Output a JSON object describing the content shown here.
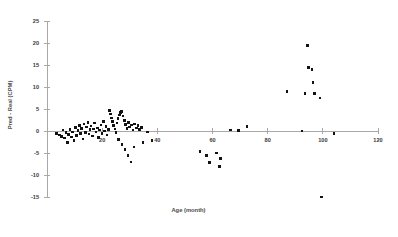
{
  "chart_data": {
    "type": "scatter",
    "title": "",
    "xlabel": "Age (month)",
    "ylabel": "Pred - Real (CPM)",
    "xlim": [
      0,
      120
    ],
    "ylim": [
      -15,
      25
    ],
    "xticks": [
      0,
      20,
      40,
      60,
      80,
      100,
      120
    ],
    "xtick_labels": [
      "",
      "20",
      "40",
      "60",
      "80",
      "100",
      "120"
    ],
    "yticks": [
      -15,
      -10,
      -5,
      0,
      5,
      10,
      15,
      20,
      25
    ],
    "ytick_labels": [
      "-15",
      "-10",
      "-5",
      "0",
      "5",
      "10",
      "15",
      "20",
      "25"
    ],
    "grid": false,
    "legend": null,
    "marker": {
      "shape": "square",
      "size": 2.6,
      "color": "#121212"
    },
    "series": [
      {
        "name": "Pred - Real",
        "points": [
          [
            3.5,
            -0.6
          ],
          [
            4.5,
            -0.9
          ],
          [
            5.2,
            -1.2
          ],
          [
            5.8,
            0.2
          ],
          [
            6.3,
            -1.6
          ],
          [
            6.9,
            -0.4
          ],
          [
            7.4,
            -2.6
          ],
          [
            7.9,
            -0.8
          ],
          [
            8.4,
            0.4
          ],
          [
            8.9,
            -1.4
          ],
          [
            9.3,
            -0.2
          ],
          [
            9.8,
            -2.2
          ],
          [
            10.3,
            0.8
          ],
          [
            10.8,
            -1.0
          ],
          [
            11.2,
            0.1
          ],
          [
            11.7,
            1.2
          ],
          [
            12.1,
            -0.5
          ],
          [
            12.6,
            0.6
          ],
          [
            13.0,
            -1.8
          ],
          [
            13.4,
            1.6
          ],
          [
            13.9,
            -0.3
          ],
          [
            14.3,
            0.9
          ],
          [
            14.8,
            2.0
          ],
          [
            15.2,
            -0.7
          ],
          [
            15.6,
            0.3
          ],
          [
            16.0,
            1.1
          ],
          [
            16.5,
            -1.1
          ],
          [
            16.9,
            0.5
          ],
          [
            17.3,
            1.8
          ],
          [
            17.8,
            -0.2
          ],
          [
            18.2,
            0.7
          ],
          [
            18.7,
            -1.5
          ],
          [
            19.1,
            0.2
          ],
          [
            19.6,
            1.4
          ],
          [
            20.0,
            -0.6
          ],
          [
            20.5,
            2.2
          ],
          [
            20.9,
            0.0
          ],
          [
            21.4,
            1.0
          ],
          [
            21.8,
            -0.9
          ],
          [
            22.3,
            0.4
          ],
          [
            22.7,
            4.6
          ],
          [
            23.0,
            3.9
          ],
          [
            23.4,
            3.0
          ],
          [
            23.8,
            2.2
          ],
          [
            24.2,
            1.3
          ],
          [
            24.6,
            0.5
          ],
          [
            25.0,
            -0.4
          ],
          [
            25.4,
            1.8
          ],
          [
            25.8,
            2.8
          ],
          [
            26.2,
            3.6
          ],
          [
            26.6,
            4.2
          ],
          [
            27.0,
            4.4
          ],
          [
            27.5,
            3.4
          ],
          [
            28.0,
            2.4
          ],
          [
            28.5,
            1.5
          ],
          [
            29.0,
            0.6
          ],
          [
            29.5,
            1.9
          ],
          [
            30.0,
            0.9
          ],
          [
            30.6,
            1.4
          ],
          [
            31.2,
            0.2
          ],
          [
            31.8,
            1.6
          ],
          [
            32.4,
            0.7
          ],
          [
            33.0,
            1.2
          ],
          [
            33.6,
            0.3
          ],
          [
            34.2,
            0.8
          ],
          [
            26.0,
            -1.9
          ],
          [
            27.2,
            -3.0
          ],
          [
            28.3,
            -4.2
          ],
          [
            29.4,
            -5.6
          ],
          [
            30.5,
            -7.0
          ],
          [
            31.6,
            -3.6
          ],
          [
            34.8,
            -2.6
          ],
          [
            36.5,
            -0.2
          ],
          [
            38.0,
            -2.2
          ],
          [
            55.5,
            -4.6
          ],
          [
            57.8,
            -5.6
          ],
          [
            59.0,
            -7.2
          ],
          [
            61.5,
            -5.0
          ],
          [
            62.5,
            -8.0
          ],
          [
            63.0,
            -6.2
          ],
          [
            66.5,
            0.2
          ],
          [
            69.5,
            0.1
          ],
          [
            72.5,
            1.0
          ],
          [
            87.0,
            9.0
          ],
          [
            92.5,
            0.0
          ],
          [
            93.5,
            8.5
          ],
          [
            94.5,
            19.5
          ],
          [
            94.8,
            14.5
          ],
          [
            96.0,
            14.0
          ],
          [
            96.5,
            11.0
          ],
          [
            97.0,
            8.5
          ],
          [
            99.0,
            7.5
          ],
          [
            99.5,
            -15.0
          ],
          [
            104.0,
            -0.6
          ]
        ]
      }
    ]
  }
}
